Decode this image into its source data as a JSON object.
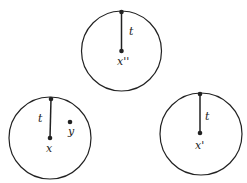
{
  "diagram": {
    "stroke_color": "#222222",
    "background": "#ffffff",
    "circles": [
      {
        "id": "top",
        "cx": 121.5,
        "cy": 51,
        "r": 40,
        "top_point": {
          "x": 121.5,
          "y": 12
        },
        "center_point": {
          "x": 121.5,
          "y": 51
        },
        "radius_label": "t",
        "radius_label_pos": {
          "x": 129,
          "y": 35
        },
        "center_label": "x''",
        "center_label_pos": {
          "x": 117,
          "y": 65
        }
      },
      {
        "id": "bottom-left",
        "cx": 50,
        "cy": 138,
        "r": 41,
        "top_point": {
          "x": 51,
          "y": 99
        },
        "center_point": {
          "x": 50,
          "y": 138
        },
        "radius_label": "t",
        "radius_label_pos": {
          "x": 38,
          "y": 122
        },
        "center_label": "x",
        "center_label_pos": {
          "x": 46,
          "y": 152
        },
        "extra_point": {
          "x": 70,
          "y": 122
        },
        "extra_label": "y",
        "extra_label_pos": {
          "x": 68,
          "y": 135
        }
      },
      {
        "id": "bottom-right",
        "cx": 201,
        "cy": 134,
        "r": 41,
        "top_point": {
          "x": 200,
          "y": 94
        },
        "center_point": {
          "x": 200,
          "y": 133
        },
        "radius_label": "t",
        "radius_label_pos": {
          "x": 205,
          "y": 120
        },
        "center_label": "x'",
        "center_label_pos": {
          "x": 195,
          "y": 149
        }
      }
    ]
  }
}
